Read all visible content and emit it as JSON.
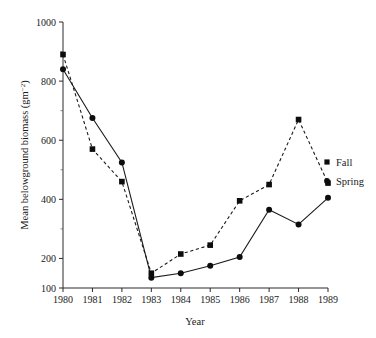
{
  "chart_data": {
    "type": "line",
    "title": "",
    "xlabel": "Year",
    "ylabel": "Mean belowground biomass (gm",
    "ylabel_superscript": "−2",
    "ylabel_suffix": ")",
    "x": [
      1980,
      1981,
      1982,
      1983,
      1984,
      1985,
      1986,
      1987,
      1988,
      1989
    ],
    "xtick_labels": [
      "1980",
      "1981",
      "1982",
      "1983",
      "1984",
      "1985",
      "1986",
      "1987",
      "1988",
      "1989"
    ],
    "ytick_labels": [
      "1000",
      "800",
      "600",
      "400",
      "200",
      "100"
    ],
    "ytick_values": [
      1000,
      800,
      600,
      400,
      200,
      100
    ],
    "yminor_values": [
      900,
      700,
      500,
      300
    ],
    "xlim": [
      1980,
      1989
    ],
    "ylim": [
      100,
      1000
    ],
    "grid": false,
    "legend_position": "right",
    "series": [
      {
        "name": "Fall",
        "marker": "square",
        "linestyle": "dashed",
        "color": "#0d0d0d",
        "values": [
          890,
          570,
          460,
          150,
          215,
          245,
          395,
          450,
          670,
          455
        ]
      },
      {
        "name": "Spring",
        "marker": "circle",
        "linestyle": "solid",
        "color": "#0d0d0d",
        "values": [
          840,
          675,
          525,
          135,
          150,
          175,
          205,
          365,
          315,
          405
        ]
      }
    ],
    "legend": [
      {
        "label": "Fall",
        "marker": "square"
      },
      {
        "label": "Spring",
        "marker": "circle"
      }
    ]
  },
  "layout": {
    "plot_left": 63,
    "plot_right": 328,
    "plot_top": 22,
    "plot_bottom": 288,
    "y_value_top": 1000,
    "y_value_bottom": 100,
    "legend_x_marker": 327,
    "legend_x_text": 336,
    "legend_y_fall": 162,
    "legend_y_spring": 181
  }
}
